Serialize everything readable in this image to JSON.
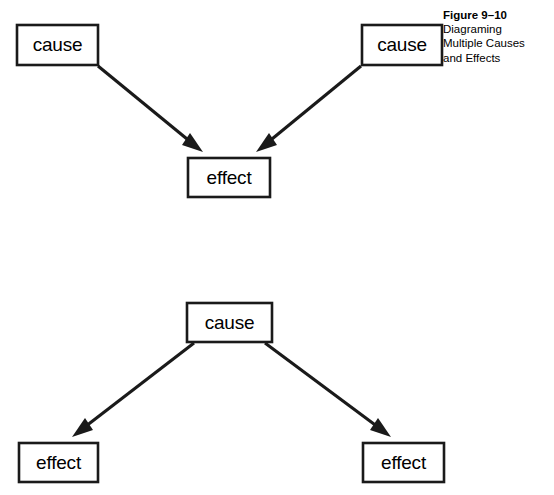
{
  "figure": {
    "caption": {
      "title": "Figure 9–10",
      "lines": [
        "Diagraming",
        "Multiple Causes",
        "and Effects"
      ]
    },
    "ink_color": "#1a1a1a",
    "background_color": "#ffffff",
    "diagrams": [
      {
        "id": "multiple-causes",
        "description": "Two causes converging on one effect",
        "nodes": [
          {
            "id": "cause-left",
            "label": "cause",
            "x": 17,
            "y": 25,
            "w": 81,
            "h": 40
          },
          {
            "id": "cause-right",
            "label": "cause",
            "x": 362,
            "y": 25,
            "w": 80,
            "h": 40
          },
          {
            "id": "effect-top",
            "label": "effect",
            "x": 188,
            "y": 158,
            "w": 82,
            "h": 39
          }
        ],
        "edges": [
          {
            "id": "cause-left-to-effect",
            "from": "cause-left",
            "to": "effect-top",
            "x1": 98,
            "y1": 66,
            "x2": 203,
            "y2": 152
          },
          {
            "id": "cause-right-to-effect",
            "from": "cause-right",
            "to": "effect-top",
            "x1": 361,
            "y1": 66,
            "x2": 256,
            "y2": 152
          }
        ]
      },
      {
        "id": "multiple-effects",
        "description": "One cause diverging into two effects",
        "nodes": [
          {
            "id": "cause-center",
            "label": "cause",
            "x": 187,
            "y": 303,
            "w": 85,
            "h": 39
          },
          {
            "id": "effect-left",
            "label": "effect",
            "x": 19,
            "y": 443,
            "w": 79,
            "h": 39
          },
          {
            "id": "effect-right",
            "label": "effect",
            "x": 363,
            "y": 443,
            "w": 81,
            "h": 39
          }
        ],
        "edges": [
          {
            "id": "cause-to-effect-left",
            "from": "cause-center",
            "to": "effect-left",
            "x1": 194,
            "y1": 343,
            "x2": 72,
            "y2": 437
          },
          {
            "id": "cause-to-effect-right",
            "from": "cause-center",
            "to": "effect-right",
            "x1": 265,
            "y1": 343,
            "x2": 391,
            "y2": 437
          }
        ]
      }
    ]
  }
}
